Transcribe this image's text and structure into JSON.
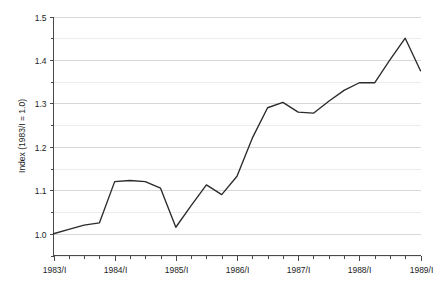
{
  "chart_data": {
    "type": "line",
    "title": "",
    "subtitle": "",
    "xlabel": "",
    "ylabel": "Index (1983/I = 1.0)",
    "ylim": [
      0.95,
      1.5
    ],
    "xlim": [
      "1983/I",
      "1989/I"
    ],
    "grid": "horizontal",
    "legend": "none",
    "y_tick_labels": [
      "1.5",
      "1.4",
      "1.3",
      "1.2",
      "1.1",
      "1.0"
    ],
    "y_tick_values": [
      1.5,
      1.4,
      1.3,
      1.2,
      1.1,
      1.0
    ],
    "y_minor_tick_values": [
      1.45,
      1.35,
      1.25,
      1.15,
      1.05,
      0.95
    ],
    "x_tick_labels": [
      "1983/I",
      "1984/I",
      "1985/I",
      "1986/I",
      "1987/I",
      "1988/I",
      "1989/I"
    ],
    "x": [
      "1983/I",
      "1983/II",
      "1983/III",
      "1983/IV",
      "1984/I",
      "1984/II",
      "1984/III",
      "1984/IV",
      "1985/I",
      "1985/II",
      "1985/III",
      "1985/IV",
      "1986/I",
      "1986/II",
      "1986/III",
      "1986/IV",
      "1987/I",
      "1987/II",
      "1987/III",
      "1987/IV",
      "1988/I",
      "1988/II",
      "1988/III",
      "1988/IV",
      "1989/I"
    ],
    "series": [
      {
        "name": "Index",
        "color": "#2b2b2b",
        "values": [
          1.0,
          1.01,
          1.02,
          1.025,
          1.12,
          1.1225,
          1.12,
          1.105,
          1.015,
          1.065,
          1.1125,
          1.09,
          1.1325,
          1.22,
          1.29,
          1.3025,
          1.28,
          1.2775,
          1.305,
          1.33,
          1.3475,
          1.3475,
          1.4,
          1.45,
          1.375
        ]
      }
    ]
  },
  "axes": {
    "y_axis_title": "Index (1983/I = 1.0)"
  }
}
